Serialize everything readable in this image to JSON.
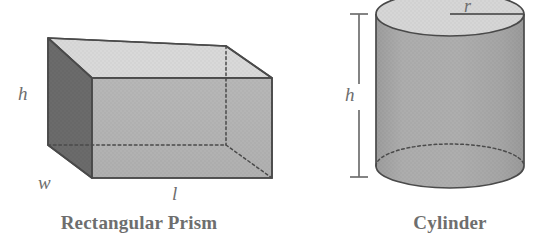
{
  "figure": {
    "background_color": "#ffffff"
  },
  "shapes": [
    {
      "id": "rectangular-prism",
      "caption": "Rectangular Prism",
      "dimension_labels": [
        {
          "key": "h",
          "text": "h",
          "meaning": "height"
        },
        {
          "key": "w",
          "text": "w",
          "meaning": "width"
        },
        {
          "key": "l",
          "text": "l",
          "meaning": "length"
        }
      ],
      "colors": {
        "top_face": "#d9d9d9",
        "front_face": "#b3b3b3",
        "side_face": "#6b6b6b",
        "outline": "#4a4a4a",
        "hidden_edge": "#4a4a4a"
      }
    },
    {
      "id": "cylinder",
      "caption": "Cylinder",
      "dimension_labels": [
        {
          "key": "h",
          "text": "h",
          "meaning": "height"
        },
        {
          "key": "r",
          "text": "r",
          "meaning": "radius"
        }
      ],
      "colors": {
        "top_face": "#d4d4d4",
        "body": "#a9a9a9",
        "outline": "#4a4a4a",
        "hidden_edge": "#4a4a4a",
        "dimension_bar": "#6e6e6e"
      }
    }
  ],
  "labels": {
    "prism_caption": "Rectangular Prism",
    "cylinder_caption": "Cylinder",
    "prism_h": "h",
    "prism_w": "w",
    "prism_l": "l",
    "cylinder_h": "h",
    "cylinder_r": "r"
  }
}
